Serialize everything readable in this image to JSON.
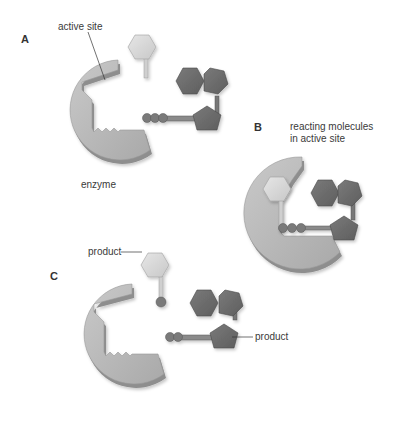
{
  "diagram": {
    "type": "enzyme-substrate mechanism",
    "panels": [
      {
        "id": "A",
        "label": "A",
        "annotations": {
          "active_site": "active site",
          "enzyme": "enzyme"
        }
      },
      {
        "id": "B",
        "label": "B",
        "annotations": {
          "caption_line1": "reacting molecules",
          "caption_line2": "in active site"
        }
      },
      {
        "id": "C",
        "label": "C",
        "annotations": {
          "product_1": "product",
          "product_2": "product"
        }
      }
    ],
    "colors": {
      "enzyme_fill": "#b9b9b9",
      "enzyme_edge": "#8c8c8c",
      "light_molecule": "#d8d8d8",
      "dark_molecule": "#6e6e6e",
      "dark_molecule_edge": "#4a4a4a",
      "leader_line": "#333333"
    }
  }
}
